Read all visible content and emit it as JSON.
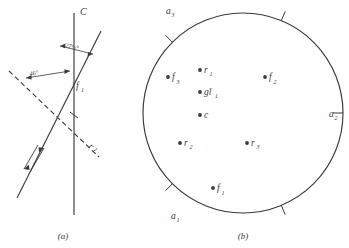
{
  "figure": {
    "panels": [
      {
        "id": "a",
        "caption": "(a)",
        "labels": {
          "cleavage": "C",
          "angle_upper": "27½°",
          "angle_lower": "46°",
          "foliation": "f",
          "foliation_sub": "1",
          "lineation": "r",
          "lineation_sub": "1"
        },
        "elements": [
          "cleavage-line-C",
          "solid-line-f1",
          "dashed-line-r1",
          "slip-arrow-pair"
        ]
      },
      {
        "id": "b",
        "caption": "(b)",
        "circle": {
          "center_label": "c",
          "rim_labels": [
            {
              "name": "a",
              "sub": "1",
              "position": "bottom-left"
            },
            {
              "name": "a",
              "sub": "2",
              "position": "right"
            },
            {
              "name": "a",
              "sub": "3",
              "position": "top-left"
            }
          ],
          "rim_ticks": 5,
          "points": [
            {
              "name": "r",
              "sub": "1",
              "x": 200,
              "y": 70
            },
            {
              "name": "gl",
              "sub": "1",
              "x": 200,
              "y": 92
            },
            {
              "name": "f",
              "sub": "3",
              "x": 168,
              "y": 77
            },
            {
              "name": "f",
              "sub": "2",
              "x": 265,
              "y": 77
            },
            {
              "name": "c",
              "sub": "",
              "x": 200,
              "y": 115
            },
            {
              "name": "r",
              "sub": "2",
              "x": 180,
              "y": 143
            },
            {
              "name": "r",
              "sub": "3",
              "x": 247,
              "y": 143
            },
            {
              "name": "f",
              "sub": "1",
              "x": 213,
              "y": 188
            }
          ]
        }
      }
    ]
  },
  "style": {
    "ink": "#3a3a3a",
    "paper": "#ffffff"
  }
}
